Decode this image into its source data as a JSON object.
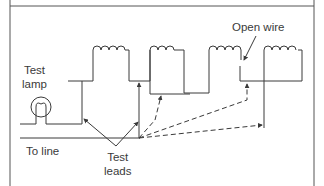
{
  "figure": {
    "type": "series circuit test diagram",
    "labels": {
      "open_wire": "Open wire",
      "test_lamp": "Test\nlamp",
      "to_line": "To line",
      "test_leads": "Test\nleads"
    },
    "colors": {
      "line": "#3a3a3a",
      "frame": "#555555",
      "background": "#ffffff"
    },
    "components": {
      "coils": 4,
      "test_lamp": 1,
      "solid_test_leads": 2,
      "dashed_test_leads": 3,
      "open_wire_break": 1
    }
  }
}
